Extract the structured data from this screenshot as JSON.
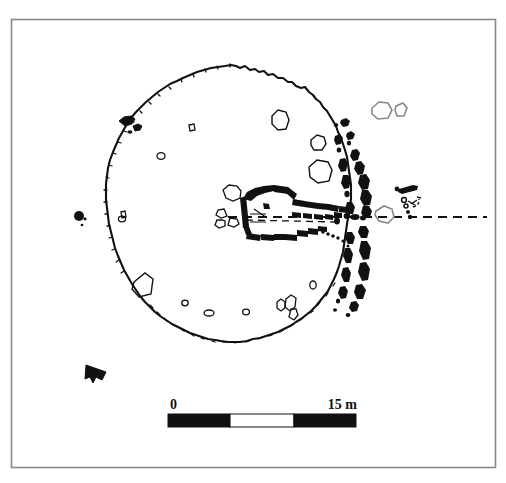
{
  "figure": {
    "kind": "archaeological-site-plan",
    "background_color": "#ffffff",
    "ink_color": "#111111",
    "frame": {
      "present": true,
      "color": "#888888",
      "x": 11,
      "y": 19,
      "width": 484,
      "height": 448
    }
  },
  "scale_bar": {
    "start_label": "0",
    "end_label": "15 m",
    "unit": "m",
    "length_value": 15,
    "x": 168,
    "y": 414,
    "width": 188,
    "height": 13,
    "segments": [
      {
        "fill": "#111111",
        "fraction": 0.33
      },
      {
        "fill": "#ffffff",
        "fraction": 0.34
      },
      {
        "fill": "#111111",
        "fraction": 0.33
      }
    ],
    "label_start_x": 170,
    "label_end_x": 356,
    "label_y": 409
  },
  "north_arrow": {
    "name": "north-arrow",
    "x": 86,
    "y": 368,
    "direction": "upper-left",
    "fill": "#111111"
  },
  "axis_line": {
    "name": "monument-axis",
    "style": "dashed",
    "y": 217,
    "x_start": 228,
    "x_end": 487,
    "dash_pattern": "9 6",
    "color": "#111111"
  },
  "features": {
    "mound_outline_label": "cairn edge",
    "kerb_label": "kerb stones",
    "passage_label": "passage",
    "chamber_label": "chamber",
    "outlier_label": "outlying stones"
  }
}
